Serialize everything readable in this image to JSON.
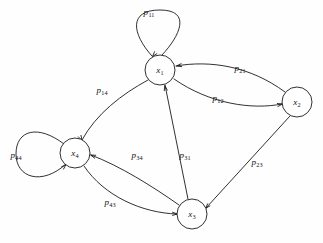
{
  "figure": {
    "type": "markov-chain-state-transition-diagram",
    "background_color": "#fefefe",
    "stroke_color": "#1a1a1a",
    "node_fill": "#ffffff"
  },
  "nodes": [
    {
      "id": "x1",
      "label_base": "x",
      "label_sub": "1",
      "cx": 160,
      "cy": 70,
      "r": 15
    },
    {
      "id": "x2",
      "label_base": "x",
      "label_sub": "2",
      "cx": 297,
      "cy": 102,
      "r": 15
    },
    {
      "id": "x3",
      "label_base": "x",
      "label_sub": "3",
      "cx": 192,
      "cy": 214,
      "r": 15
    },
    {
      "id": "x4",
      "label_base": "x",
      "label_sub": "4",
      "cx": 75,
      "cy": 153,
      "r": 15
    }
  ],
  "edges": [
    {
      "id": "p11",
      "from": "x1",
      "to": "x1",
      "kind": "self-loop",
      "label_base": "p",
      "label_sub": "11",
      "label_x": 149,
      "label_y": 12,
      "path": "M 152 56 C 132 34 128 10 160 10 C 192 10 180 36 162 55",
      "arrow_x": 152.5,
      "arrow_y": 56.5,
      "arrow_angle": 130
    },
    {
      "id": "p21",
      "from": "x2",
      "to": "x1",
      "kind": "curve",
      "label_base": "p",
      "label_sub": "21",
      "label_x": 240,
      "label_y": 68,
      "path": "M 285 92 C 250 66 210 60 176 66",
      "arrow_x": 176.5,
      "arrow_y": 66,
      "arrow_angle": 170
    },
    {
      "id": "p12",
      "from": "x1",
      "to": "x2",
      "kind": "curve",
      "label_base": "p",
      "label_sub": "12",
      "label_x": 218,
      "label_y": 98,
      "path": "M 174 79 C 210 104 252 110 282 104",
      "arrow_x": 282.5,
      "arrow_y": 104,
      "arrow_angle": -12
    },
    {
      "id": "p14",
      "from": "x1",
      "to": "x4",
      "kind": "curve",
      "label_base": "p",
      "label_sub": "14",
      "label_x": 102,
      "label_y": 90,
      "path": "M 148 80 C 122 94 96 114 82 140",
      "arrow_x": 82,
      "arrow_y": 140.5,
      "arrow_angle": 62
    },
    {
      "id": "p44",
      "from": "x4",
      "to": "x4",
      "kind": "self-loop",
      "label_base": "p",
      "label_sub": "44",
      "label_x": 16,
      "label_y": 155,
      "path": "M 64 144 C 38 124 16 130 16 154 C 16 178 42 186 66 164",
      "arrow_x": 66,
      "arrow_y": 164.5,
      "arrow_angle": -45
    },
    {
      "id": "p34",
      "from": "x3",
      "to": "x4",
      "kind": "curve",
      "label_base": "p",
      "label_sub": "34",
      "label_x": 137,
      "label_y": 155,
      "path": "M 179 205 C 152 186 120 166 91 155",
      "arrow_x": 90.5,
      "arrow_y": 155,
      "arrow_angle": 200
    },
    {
      "id": "p43",
      "from": "x4",
      "to": "x3",
      "kind": "curve",
      "label_base": "p",
      "label_sub": "43",
      "label_x": 110,
      "label_y": 202,
      "path": "M 84 166 C 104 196 142 213 177 214",
      "arrow_x": 177.5,
      "arrow_y": 214,
      "arrow_angle": 2
    },
    {
      "id": "p31",
      "from": "x3",
      "to": "x1",
      "kind": "line",
      "label_base": "p",
      "label_sub": "31",
      "label_x": 185,
      "label_y": 155,
      "path": "M 188 199 L 165 85",
      "arrow_x": 164.8,
      "arrow_y": 85.5,
      "arrow_angle": -101
    },
    {
      "id": "p23",
      "from": "x2",
      "to": "x3",
      "kind": "line",
      "label_base": "p",
      "label_sub": "23",
      "label_x": 257,
      "label_y": 162,
      "path": "M 290 116 L 206 208",
      "arrow_x": 205.5,
      "arrow_y": 208.5,
      "arrow_angle": 132
    }
  ]
}
